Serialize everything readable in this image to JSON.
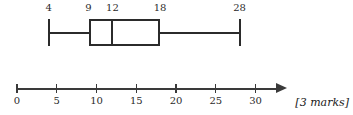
{
  "figure": {
    "kind": "box-plot-with-number-line",
    "stroke_color": "#2b2b2b",
    "axis_color": "#3a3a3a",
    "background_color": "#ffffff"
  },
  "chart_data": {
    "type": "box",
    "title": "",
    "xlabel": "",
    "ylabel": "",
    "orientation": "horizontal",
    "grid": false,
    "legend": null,
    "xlim": [
      0,
      34
    ],
    "axis": {
      "tick_labels": [
        "0",
        "5",
        "10",
        "15",
        "20",
        "25",
        "30"
      ],
      "tick_values": [
        0,
        5,
        10,
        15,
        20,
        25,
        30
      ],
      "tick_interval": 5,
      "arrow_at_end": true,
      "start_value": 0,
      "end_value": 34
    },
    "box": {
      "minimum": 4,
      "lower_quartile": 9,
      "median": 12,
      "upper_quartile": 18,
      "maximum": 28
    },
    "value_labels": [
      {
        "text": "4",
        "value": 4
      },
      {
        "text": "9",
        "value": 9
      },
      {
        "text": "12",
        "value": 12
      },
      {
        "text": "18",
        "value": 18
      },
      {
        "text": "28",
        "value": 28
      }
    ]
  },
  "annotation": {
    "marks": "[3 marks]"
  }
}
